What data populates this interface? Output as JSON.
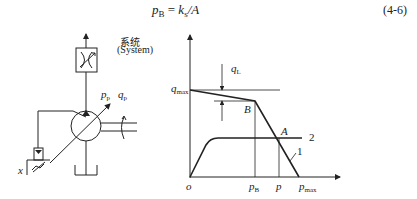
{
  "equation": {
    "lhs_var": "p",
    "lhs_sub": "B",
    "equals": " = ",
    "rhs_var": "k",
    "rhs_sub": "s",
    "rhs_rest": "/A",
    "number": "(4-6)"
  },
  "schematic": {
    "system_label_cn": "系统",
    "system_label_en": "(System)",
    "pump_pressure_var": "p",
    "pump_pressure_sub": "p",
    "pump_flow_var": "q",
    "pump_flow_sub": "p",
    "displacement_label": "x"
  },
  "graph": {
    "y_label_var": "q",
    "y_label_sub": "max",
    "leak_label_var": "q",
    "leak_label_sub": "L",
    "point_B": "B",
    "point_A": "A",
    "curve1_label": "1",
    "curve2_label": "2",
    "origin_label": "o",
    "x_ticks": [
      {
        "var": "p",
        "sub": "B"
      },
      {
        "var": "p",
        "sub": ""
      },
      {
        "var": "p",
        "sub": "max"
      }
    ]
  },
  "colors": {
    "line": "#222222",
    "background": "#ffffff"
  }
}
